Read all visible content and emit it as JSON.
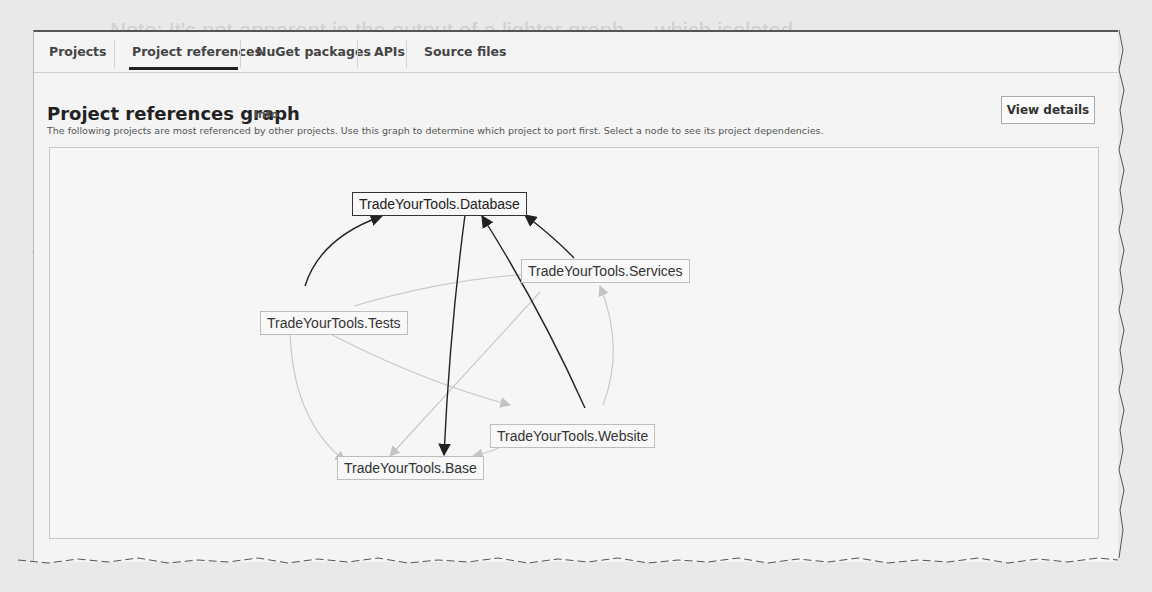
{
  "tabs": [
    {
      "label": "Projects",
      "active": false
    },
    {
      "label": "Project references",
      "active": true
    },
    {
      "label": "NuGet packages",
      "active": false
    },
    {
      "label": "APIs",
      "active": false
    },
    {
      "label": "Source files",
      "active": false
    }
  ],
  "section": {
    "title": "Project references graph",
    "info_link": "Info",
    "description": "The following projects are most referenced by other projects. Use this graph to determine which project to port first. Select a node to see its project dependencies.",
    "view_details_button": "View details"
  },
  "graph": {
    "nodes": [
      {
        "id": "database",
        "label": "TradeYourTools.Database",
        "selected": true
      },
      {
        "id": "services",
        "label": "TradeYourTools.Services",
        "selected": false
      },
      {
        "id": "tests",
        "label": "TradeYourTools.Tests",
        "selected": false
      },
      {
        "id": "website",
        "label": "TradeYourTools.Website",
        "selected": false
      },
      {
        "id": "base",
        "label": "TradeYourTools.Base",
        "selected": false
      }
    ],
    "edges_highlighted": [
      {
        "from": "tests",
        "to": "database"
      },
      {
        "from": "database",
        "to": "base"
      },
      {
        "from": "website",
        "to": "database"
      },
      {
        "from": "services",
        "to": "database"
      }
    ],
    "edges_dimmed": [
      {
        "from": "tests",
        "to": "services"
      },
      {
        "from": "tests",
        "to": "website"
      },
      {
        "from": "tests",
        "to": "base"
      },
      {
        "from": "services",
        "to": "base"
      },
      {
        "from": "website",
        "to": "services"
      },
      {
        "from": "website",
        "to": "base"
      }
    ]
  },
  "background_page_text": [
    "Note: It's not apparent in the output of a lighter graph ... which isolated",
    "the standalone project applications ...",
    "to create ... in parallel. When using the ... they can only assess",
    "... is in the script and the file ...",
    "Dialog ... the graph ... project ... into the context of the",
    "... other ... should ... shown in Figure ..."
  ]
}
